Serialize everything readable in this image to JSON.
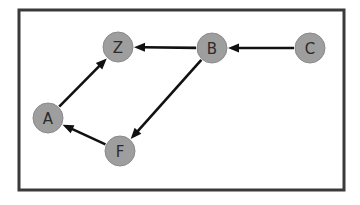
{
  "figure": {
    "width": 360,
    "height": 205,
    "background_color": "#ffffff"
  },
  "frame": {
    "x": 19,
    "y": 10,
    "width": 325,
    "height": 180,
    "stroke_color": "#3a3a3a",
    "stroke_width": 3,
    "fill_color": "#ffffff"
  },
  "style": {
    "node_fill": "#9e9e9e",
    "node_stroke": "#8a8a8a",
    "node_stroke_width": 1,
    "node_radius": 15,
    "label_color": "#2b2b2b",
    "edge_color": "#111111",
    "edge_width": 2.6,
    "arrowhead_length": 11,
    "arrowhead_width": 9
  },
  "graph": {
    "type": "directed",
    "node_count": 5,
    "edge_count": 5,
    "nodes": [
      {
        "id": "Z",
        "label": "Z",
        "x": 118,
        "y": 47
      },
      {
        "id": "B",
        "label": "B",
        "x": 212,
        "y": 48
      },
      {
        "id": "C",
        "label": "C",
        "x": 310,
        "y": 48
      },
      {
        "id": "A",
        "label": "A",
        "x": 48,
        "y": 118
      },
      {
        "id": "F",
        "label": "F",
        "x": 120,
        "y": 151
      }
    ],
    "edges": [
      {
        "id": "B-Z",
        "source": "B",
        "target": "Z",
        "label": "B → Z"
      },
      {
        "id": "C-B",
        "source": "C",
        "target": "B",
        "label": "C → B"
      },
      {
        "id": "A-Z",
        "source": "A",
        "target": "Z",
        "label": "A → Z"
      },
      {
        "id": "B-F",
        "source": "B",
        "target": "F",
        "label": "B → F"
      },
      {
        "id": "F-A",
        "source": "F",
        "target": "A",
        "label": "F → A"
      }
    ]
  }
}
